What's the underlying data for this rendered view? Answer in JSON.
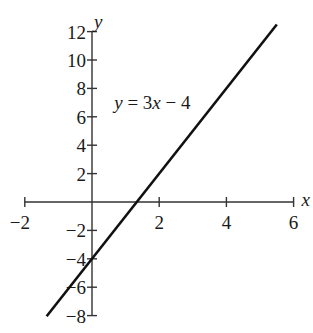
{
  "chart_data": {
    "type": "line",
    "title": "",
    "xlabel": "x",
    "ylabel": "y",
    "xlim": [
      -2,
      6
    ],
    "ylim": [
      -8,
      12
    ],
    "grid": false,
    "x_ticks": [
      -2,
      2,
      4,
      6
    ],
    "y_ticks": [
      -8,
      -6,
      -4,
      -2,
      2,
      4,
      6,
      8,
      10,
      12
    ],
    "x_tick_labels": [
      "−2",
      "2",
      "4",
      "6"
    ],
    "y_tick_labels": [
      "−8",
      "−6",
      "−4",
      "−2",
      "2",
      "4",
      "6",
      "8",
      "10",
      "12"
    ],
    "series": [
      {
        "name": "y = 3x − 4",
        "equation": "y = 3x - 4",
        "slope": 3,
        "intercept": -4,
        "x": [
          -1.35,
          5.5
        ],
        "y": [
          -8.05,
          12.5
        ],
        "color": "#111111"
      }
    ],
    "annotations": [
      {
        "text_parts": [
          "y",
          " = 3",
          "x",
          " − 4"
        ],
        "x": 0.75,
        "y": 7
      }
    ],
    "legend": null
  }
}
